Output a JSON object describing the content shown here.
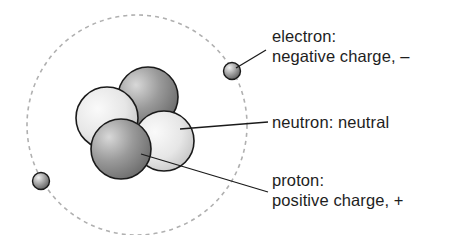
{
  "diagram": {
    "labels": {
      "electron": {
        "line1": "electron:",
        "line2": "negative charge, –"
      },
      "neutron": {
        "line1": "neutron: neutral"
      },
      "proton": {
        "line1": "proton:",
        "line2": "positive charge, +"
      }
    },
    "parts": [
      "electron",
      "neutron",
      "proton"
    ],
    "colors": {
      "orbit": "#b0b0b0",
      "outline": "#1a1a1a",
      "proton_fill": "#8a8a8a",
      "neutron_fill": "#e4e4e4",
      "text": "#1e1e1e"
    }
  }
}
